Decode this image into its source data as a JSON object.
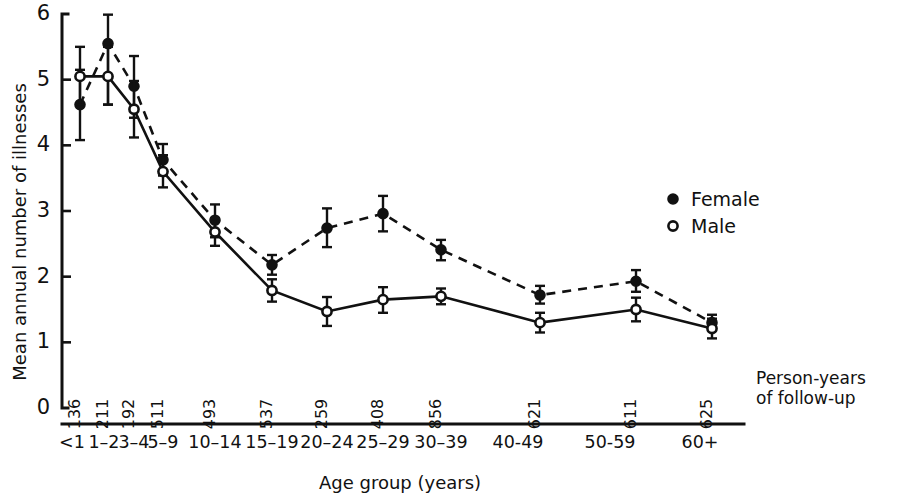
{
  "chart_data": {
    "type": "line",
    "title": "",
    "xlabel": "Age group (years)",
    "ylabel": "Mean annual number of illnesses",
    "ylim": [
      0,
      6
    ],
    "yticks": [
      0,
      1,
      2,
      3,
      4,
      5,
      6
    ],
    "ytick_labels": [
      "0",
      "1",
      "2",
      "3",
      "4",
      "5",
      "6"
    ],
    "grid": false,
    "legend_position": "right-upper",
    "categories": [
      "<1",
      "1–2",
      "3–4",
      "5–9",
      "10–14",
      "15–19",
      "20–24",
      "25–29",
      "30–39",
      "40-49",
      "50-59",
      "60+"
    ],
    "person_years_note": [
      "Person-years",
      "of follow-up"
    ],
    "person_years": [
      136,
      211,
      192,
      511,
      493,
      537,
      259,
      408,
      856,
      621,
      611,
      625
    ],
    "series": [
      {
        "name": "Female",
        "marker": "filled-circle",
        "linestyle": "dashed",
        "values": [
          4.62,
          5.55,
          4.9,
          3.78,
          2.86,
          2.18,
          2.74,
          2.96,
          2.41,
          1.72,
          1.93,
          1.3
        ],
        "err_low": [
          4.08,
          4.62,
          4.42,
          3.54,
          2.6,
          2.03,
          2.45,
          2.69,
          2.25,
          1.59,
          1.77,
          1.18
        ],
        "err_high": [
          5.15,
          5.99,
          5.36,
          4.02,
          3.1,
          2.33,
          3.04,
          3.23,
          2.56,
          1.86,
          2.1,
          1.42
        ]
      },
      {
        "name": "Male",
        "marker": "open-circle",
        "linestyle": "solid",
        "values": [
          5.05,
          5.05,
          4.55,
          3.6,
          2.68,
          1.79,
          1.47,
          1.65,
          1.7,
          1.3,
          1.5,
          1.21
        ],
        "err_low": [
          4.62,
          4.62,
          4.12,
          3.36,
          2.47,
          1.62,
          1.25,
          1.45,
          1.58,
          1.15,
          1.32,
          1.06
        ],
        "err_high": [
          5.5,
          5.5,
          4.98,
          3.85,
          2.89,
          1.96,
          1.69,
          1.84,
          1.82,
          1.45,
          1.68,
          1.36
        ]
      }
    ]
  },
  "legend": {
    "items": [
      {
        "label": "Female",
        "marker": "filled-circle"
      },
      {
        "label": "Male",
        "marker": "open-circle"
      }
    ]
  }
}
